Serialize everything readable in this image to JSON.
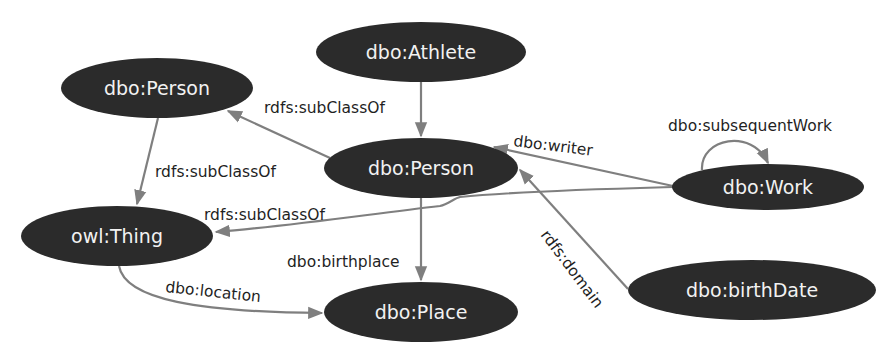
{
  "diagram": {
    "type": "rdf-ontology-graph",
    "colors": {
      "node_fill": "#2b2b2b",
      "node_text": "#f2f2f2",
      "edge": "#7f7f7f",
      "label": "#1f1f1f",
      "background": "#ffffff"
    },
    "nodes": [
      {
        "id": "athlete",
        "label": "dbo:Athlete",
        "cx": 421,
        "cy": 52,
        "rx": 105,
        "ry": 30
      },
      {
        "id": "person_l",
        "label": "dbo:Person",
        "cx": 157,
        "cy": 88,
        "rx": 96,
        "ry": 30
      },
      {
        "id": "person_c",
        "label": "dbo:Person",
        "cx": 421,
        "cy": 168,
        "rx": 97,
        "ry": 30
      },
      {
        "id": "work",
        "label": "dbo:Work",
        "cx": 768,
        "cy": 187,
        "rx": 96,
        "ry": 23
      },
      {
        "id": "thing",
        "label": "owl:Thing",
        "cx": 117,
        "cy": 236,
        "rx": 96,
        "ry": 30
      },
      {
        "id": "place",
        "label": "dbo:Place",
        "cx": 421,
        "cy": 312,
        "rx": 97,
        "ry": 30
      },
      {
        "id": "birthdate",
        "label": "dbo:birthDate",
        "cx": 752,
        "cy": 290,
        "rx": 124,
        "ry": 30
      }
    ],
    "edges": [
      {
        "id": "athlete-person",
        "from": "dbo:Athlete",
        "to": "dbo:Person (center)",
        "label": "rdfs:subClassOf"
      },
      {
        "id": "person-personl",
        "from": "dbo:Person (center)",
        "to": "dbo:Person (left)",
        "label": "rdfs:subClassOf"
      },
      {
        "id": "personl-thing",
        "from": "dbo:Person (left)",
        "to": "owl:Thing",
        "label": "rdfs:subClassOf"
      },
      {
        "id": "work-thing",
        "from": "dbo:Work",
        "to": "owl:Thing",
        "label": "rdfs:subClassOf"
      },
      {
        "id": "work-person",
        "from": "dbo:Work",
        "to": "dbo:Person (center)",
        "label": "dbo:writer"
      },
      {
        "id": "work-work",
        "from": "dbo:Work",
        "to": "dbo:Work",
        "label": "dbo:subsequentWork"
      },
      {
        "id": "person-place",
        "from": "dbo:Person (center)",
        "to": "dbo:Place",
        "label": "dbo:birthplace"
      },
      {
        "id": "thing-place",
        "from": "owl:Thing",
        "to": "dbo:Place",
        "label": "dbo:location"
      },
      {
        "id": "birthdate-person",
        "from": "dbo:birthDate",
        "to": "dbo:Person (center)",
        "label": "rdfs:domain"
      }
    ]
  }
}
